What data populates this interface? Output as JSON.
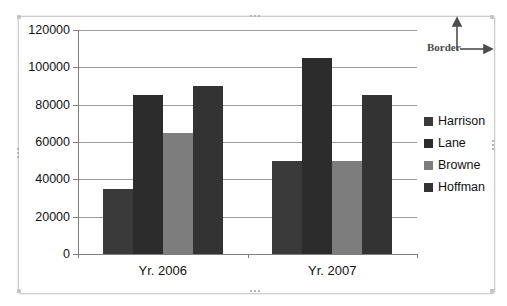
{
  "chart_data": {
    "type": "bar",
    "title": "",
    "xlabel": "",
    "ylabel": "",
    "categories": [
      "Yr. 2006",
      "Yr. 2007"
    ],
    "series": [
      {
        "name": "Harrison",
        "color": "#3a3a3a",
        "values": [
          35000,
          50000
        ]
      },
      {
        "name": "Lane",
        "color": "#2c2c2c",
        "values": [
          85000,
          105000
        ]
      },
      {
        "name": "Browne",
        "color": "#7d7d7d",
        "values": [
          65000,
          50000
        ]
      },
      {
        "name": "Hoffman",
        "color": "#333333",
        "values": [
          90000,
          85000
        ]
      }
    ],
    "ylim": [
      0,
      120000
    ],
    "ytick_interval": 20000,
    "ytick_labels": [
      "0",
      "20000",
      "40000",
      "60000",
      "80000",
      "100000",
      "120000"
    ],
    "grid": true,
    "legend_position": "right"
  },
  "annotation": {
    "border_label": "Border"
  },
  "colors": {
    "gridline": "#9b9b9b",
    "axis": "#7f7f7f",
    "frame_border": "#cdcdcd",
    "arrow": "#4d4d4d",
    "text": "#111111"
  }
}
